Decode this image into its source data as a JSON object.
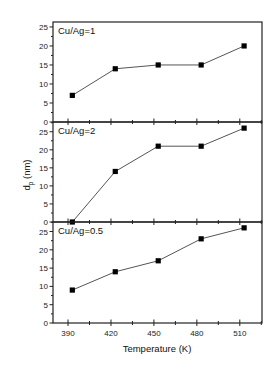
{
  "chart_data": {
    "type": "line",
    "layout": "stacked-panels-shared-x",
    "xlabel": "Temperature (K)",
    "ylabel": "d_p (nm)",
    "ylabel_main": "d",
    "ylabel_sub": "p",
    "ylabel_unit": " (nm)",
    "xlim": [
      379.5,
      525.5
    ],
    "x_ticks": [
      390,
      420,
      450,
      480,
      510
    ],
    "x_tick_labels": [
      "390",
      "420",
      "450",
      "480",
      "510"
    ],
    "x": [
      393,
      423,
      453,
      483,
      513
    ],
    "grid": false,
    "legend": "none",
    "marker": "filled-square",
    "line_color": "#555555",
    "marker_color": "#000000",
    "panels": [
      {
        "label": "Cu/Ag=1",
        "ylim": [
          0,
          26.3
        ],
        "y_ticks": [
          0,
          5,
          10,
          15,
          20,
          25
        ],
        "y_tick_labels": [
          "0",
          "5",
          "10",
          "15",
          "20",
          "25"
        ],
        "series": [
          {
            "name": "Cu/Ag=1",
            "values": [
              7,
              14,
              15,
              15,
              20
            ]
          }
        ]
      },
      {
        "label": "Cu/Ag=2",
        "ylim": [
          0,
          27.7
        ],
        "y_ticks": [
          0,
          5,
          10,
          15,
          20,
          25
        ],
        "y_tick_labels": [
          "0",
          "5",
          "10",
          "15",
          "20",
          "25"
        ],
        "series": [
          {
            "name": "Cu/Ag=2",
            "values": [
              0,
              14,
              21,
              21,
              26
            ]
          }
        ]
      },
      {
        "label": "Cu/Ag=0.5",
        "ylim": [
          0,
          27.6
        ],
        "y_ticks": [
          0,
          5,
          10,
          15,
          20,
          25
        ],
        "y_tick_labels": [
          "0",
          "5",
          "10",
          "15",
          "20",
          "25"
        ],
        "series": [
          {
            "name": "Cu/Ag=0.5",
            "values": [
              9,
              14,
              17,
              23,
              26
            ]
          }
        ]
      }
    ]
  }
}
